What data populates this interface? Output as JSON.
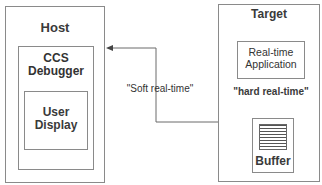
{
  "host": {
    "title": "Host",
    "debugger": {
      "label_line1": "CCS",
      "label_line2": "Debugger"
    },
    "user_display": {
      "label_line1": "User",
      "label_line2": "Display"
    }
  },
  "target": {
    "title": "Target",
    "application": {
      "label_line1": "Real-time",
      "label_line2": "Application"
    },
    "link_label": "\"hard real-time\"",
    "buffer": {
      "label": "Buffer"
    }
  },
  "connection": {
    "label": "\"Soft real-time\""
  }
}
